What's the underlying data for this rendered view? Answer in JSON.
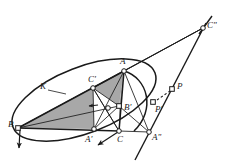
{
  "figure": {
    "type": "geometry-diagram",
    "width": 236,
    "height": 164,
    "background": "#ffffff",
    "stroke_color": "#1a1a1a",
    "shade_fill": "#a8a8a8",
    "shade_fill_light": "#bdbdbd",
    "node_fill": "#ffffff"
  },
  "points": [
    {
      "id": "B",
      "label": "B",
      "x": 18,
      "y": 128,
      "lx": 8,
      "ly": 127,
      "marker": "square"
    },
    {
      "id": "A",
      "label": "A",
      "x": 124,
      "y": 71,
      "lx": 120,
      "ly": 64,
      "marker": "circle"
    },
    {
      "id": "C",
      "label": "C",
      "x": 119,
      "y": 131,
      "lx": 117,
      "ly": 142,
      "marker": "circle"
    },
    {
      "id": "Ap",
      "label": "A'",
      "x": 94,
      "y": 129,
      "lx": 85,
      "ly": 142,
      "marker": "circle"
    },
    {
      "id": "Bp",
      "label": "B'",
      "x": 119,
      "y": 106,
      "lx": 124,
      "ly": 110,
      "marker": "square"
    },
    {
      "id": "Cp",
      "label": "C'",
      "x": 93,
      "y": 88,
      "lx": 88,
      "ly": 82,
      "marker": "circle"
    },
    {
      "id": "App",
      "label": "A\"",
      "x": 149,
      "y": 132,
      "lx": 152,
      "ly": 140,
      "marker": "circle"
    },
    {
      "id": "Cpp",
      "label": "C\"",
      "x": 203,
      "y": 28,
      "lx": 207,
      "ly": 28,
      "marker": "circle"
    },
    {
      "id": "P",
      "label": "P",
      "x": 172,
      "y": 89,
      "lx": 177,
      "ly": 89,
      "marker": "square"
    },
    {
      "id": "Pp",
      "label": "P'",
      "x": 153,
      "y": 102,
      "lx": 155,
      "ly": 112,
      "marker": "square"
    },
    {
      "id": "X",
      "label": "",
      "x": 108,
      "y": 108,
      "lx": 0,
      "ly": 0,
      "marker": "circle"
    }
  ],
  "curve_label": {
    "text": "K",
    "x": 40,
    "y": 89,
    "leader_from_x": 48,
    "leader_from_y": 90,
    "leader_to_x": 66,
    "leader_to_y": 94
  },
  "segments": [
    {
      "name": "side-BA",
      "from": "B",
      "to": "A"
    },
    {
      "name": "side-BC",
      "from": "B",
      "to": "C"
    },
    {
      "name": "side-AC",
      "from": "A",
      "to": "C"
    },
    {
      "name": "cevian-A-Ap",
      "from": "A",
      "to": "Ap"
    },
    {
      "name": "cevian-B-Bp",
      "from": "B",
      "to": "Bp"
    },
    {
      "name": "cevian-C-Cp",
      "from": "C",
      "to": "Cp"
    },
    {
      "name": "med-Cp-Ap",
      "from": "Cp",
      "to": "Ap"
    },
    {
      "name": "med-Cp-Bp",
      "from": "Cp",
      "to": "Bp"
    },
    {
      "name": "med-Ap-Bp",
      "from": "Ap",
      "to": "Bp"
    },
    {
      "name": "ray-B-Cpp",
      "from": "B",
      "to": "Cpp"
    },
    {
      "name": "ray-A-Cpp",
      "from": "A",
      "to": "Cpp"
    },
    {
      "name": "ray-Cp-Cpp",
      "from": "Cp",
      "to": "Cpp"
    },
    {
      "name": "base-C-App",
      "from": "C",
      "to": "App"
    },
    {
      "name": "chord-A-App",
      "from": "A",
      "to": "App"
    },
    {
      "name": "chord-Bp-App",
      "from": "Bp",
      "to": "App"
    },
    {
      "name": "chord-Cp-C",
      "from": "Cp",
      "to": "C"
    }
  ],
  "shaded_regions": [
    {
      "name": "triangle-B-Cp-Ap",
      "vertices": [
        "B",
        "Cp",
        "Ap"
      ],
      "tone": "mid"
    },
    {
      "name": "triangle-A-Cp-Bp",
      "vertices": [
        "A",
        "Cp",
        "Bp"
      ],
      "tone": "mid"
    },
    {
      "name": "triangle-A-Bp-C",
      "vertices": [
        "A",
        "Bp",
        "C"
      ],
      "tone": "mid"
    }
  ],
  "arrows": [
    {
      "name": "arrow-at-B",
      "x1": 20,
      "y1": 130,
      "x2": 19,
      "y2": 148
    },
    {
      "name": "arrow-below-C",
      "x1": 118,
      "y1": 132,
      "x2": 98,
      "y2": 145
    },
    {
      "name": "arrow-interior",
      "x1": 98,
      "y1": 105,
      "x2": 89,
      "y2": 106
    }
  ],
  "dashed": [
    {
      "name": "dash-Pp-P",
      "x1": 157,
      "y1": 100,
      "x2": 170,
      "y2": 91
    }
  ],
  "conic": {
    "name": "circumconic-K",
    "cx": 84,
    "cy": 100,
    "rx": 76,
    "ry": 33,
    "rotation": -21
  },
  "arc_right": {
    "name": "arc-through-A-C",
    "d": "M 124 71 C 148 78, 156 110, 134 131"
  },
  "lines_extended": [
    {
      "name": "line-Cpp-through-P-Pp",
      "x1": 206,
      "y1": 23,
      "x2": 135,
      "y2": 160
    },
    {
      "name": "line-Cpp-upper",
      "x1": 212,
      "y1": 16,
      "x2": 199,
      "y2": 34
    }
  ]
}
